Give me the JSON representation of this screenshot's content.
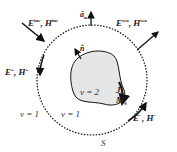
{
  "diagram": {
    "type": "scattering-geometry",
    "incident_field": {
      "E": "E",
      "H": "H",
      "sup": "inc"
    },
    "scattered_field": {
      "E": "E",
      "H": "H",
      "sup": "sca"
    },
    "exterior_field_left": {
      "E": "E",
      "H": "H",
      "sup": "+"
    },
    "exterior_field_right": {
      "E": "E",
      "H": "H",
      "sup": "−"
    },
    "outer_normal": {
      "symbol": "â",
      "sub": "n"
    },
    "inner_normal": {
      "symbol": "n̂"
    },
    "region_inner": "v = 2",
    "region_outer_left": "v = 1",
    "region_outer_right": "v = 1",
    "current_J": {
      "symbol": "J",
      "sub": "S"
    },
    "current_M": {
      "symbol": "M",
      "sub": "S"
    },
    "surface": "S",
    "colors": {
      "stroke": "#111111",
      "scatterer_fill": "#e6e6e6",
      "background": "#ffffff"
    }
  }
}
